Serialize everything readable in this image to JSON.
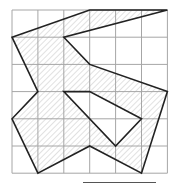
{
  "diagram": {
    "type": "grid-polygon",
    "grid": {
      "cols": 6,
      "rows": 6,
      "origin_px": [
        12,
        10
      ],
      "cell_w": 25.9,
      "cell_h": 27.2,
      "line_color": "#a6a6a6"
    },
    "shape": {
      "outline_color": "#222222",
      "hatch_color": "#b5b5b5",
      "outer": [
        [
          0,
          1
        ],
        [
          3,
          0
        ],
        [
          6,
          0
        ],
        [
          2,
          1
        ],
        [
          3,
          2
        ],
        [
          6,
          3
        ],
        [
          5,
          6
        ],
        [
          3,
          5
        ],
        [
          1,
          6
        ],
        [
          0,
          4
        ],
        [
          1,
          3
        ]
      ],
      "hole": [
        [
          2,
          3
        ],
        [
          3,
          3
        ],
        [
          5,
          4
        ],
        [
          4,
          5
        ]
      ]
    },
    "answer_line": {
      "x1": 83,
      "x2": 156,
      "y": 182
    }
  }
}
